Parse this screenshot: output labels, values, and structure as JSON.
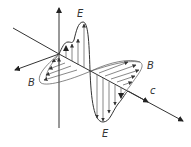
{
  "diagram": {
    "labels": {
      "e_top": "E",
      "e_bottom": "E",
      "b_left": "B",
      "b_right": "B",
      "propagation": "c"
    },
    "colors": {
      "line": "#333333",
      "background": "#ffffff"
    }
  }
}
